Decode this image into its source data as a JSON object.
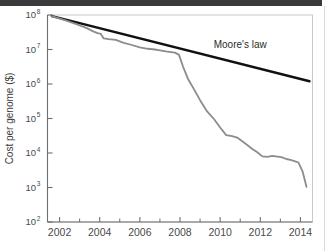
{
  "figure": {
    "background_color": "#ffffff",
    "top_band_color": "#3a3a3c",
    "right_rule_color": "#d8d8d8"
  },
  "chart_data": {
    "type": "line",
    "title": "",
    "subtitle": "",
    "xlabel": "",
    "ylabel": "Cost per genome ($)",
    "yscale": "log",
    "xscale": "linear",
    "xlim": [
      2001.4,
      2014.6
    ],
    "ylim": [
      100,
      100000000
    ],
    "grid": false,
    "legend_position": "inline-annotation",
    "plot_frame_color": "#c9c9c9",
    "axis_color": "#6f6f6f",
    "xticks": [
      2002,
      2004,
      2006,
      2008,
      2010,
      2012,
      2014
    ],
    "xtick_labels": [
      "2002",
      "2004",
      "2006",
      "2008",
      "2010",
      "2012",
      "2014"
    ],
    "xminor_ticks": [
      2003,
      2005,
      2007,
      2009,
      2011,
      2013
    ],
    "yticks": [
      100,
      1000,
      10000,
      100000,
      1000000,
      10000000,
      100000000
    ],
    "ytick_labels": [
      "10",
      "10",
      "10",
      "10",
      "10",
      "10",
      "10"
    ],
    "ytick_exponents": [
      "2",
      "3",
      "4",
      "5",
      "6",
      "7",
      "8"
    ],
    "annotations": [
      {
        "text": "Moore's law",
        "x": 2011.0,
        "y": 11000000,
        "color": "#2b2b2b"
      }
    ],
    "series": [
      {
        "name": "Moore's law",
        "color": "#111111",
        "width": 2.4,
        "x": [
          2001.62,
          2014.45
        ],
        "values": [
          93000000,
          1200000
        ]
      },
      {
        "name": "Cost per genome",
        "color": "#8c8c8c",
        "width": 1.8,
        "x": [
          2001.62,
          2002.3,
          2002.8,
          2003.3,
          2003.7,
          2003.9,
          2004.05,
          2004.2,
          2004.45,
          2004.8,
          2005.2,
          2005.6,
          2006.0,
          2006.4,
          2006.75,
          2007.0,
          2007.3,
          2007.55,
          2007.75,
          2007.95,
          2008.15,
          2008.4,
          2008.7,
          2009.0,
          2009.35,
          2009.7,
          2010.0,
          2010.3,
          2010.6,
          2010.85,
          2011.1,
          2011.35,
          2011.6,
          2011.85,
          2012.1,
          2012.35,
          2012.6,
          2012.85,
          2013.05,
          2013.3,
          2013.5,
          2013.7,
          2013.9,
          2014.1,
          2014.3
        ],
        "values": [
          93000000,
          70000000,
          55000000,
          43000000,
          33000000,
          30000000,
          28500000,
          21000000,
          20000000,
          19000000,
          15500000,
          13500000,
          11500000,
          10500000,
          10000000,
          9500000,
          8800000,
          8400000,
          8100000,
          7000000,
          3200000,
          1400000,
          700000,
          340000,
          160000,
          95000,
          55000,
          33000,
          31000,
          28000,
          22000,
          17000,
          13000,
          10500,
          8000,
          7700,
          8200,
          7900,
          7600,
          6700,
          6300,
          5800,
          5300,
          3000,
          1050
        ]
      }
    ]
  }
}
